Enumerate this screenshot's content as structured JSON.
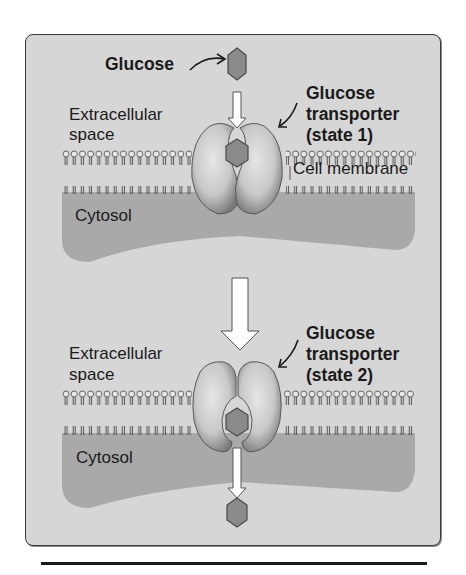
{
  "figure": {
    "colors": {
      "background": "#d6d6d6",
      "cytosol": "#a9a9a9",
      "glucose": "#8a8a8a",
      "protein": "#c4c4c4",
      "arrow": "#ffffff",
      "text": "#1a1a1a"
    },
    "panels": [
      {
        "id": "state-1",
        "labels": {
          "glucose": "Glucose",
          "extracellular_line1": "Extracellular",
          "extracellular_line2": "space",
          "transporter_line1": "Glucose",
          "transporter_line2": "transporter",
          "transporter_line3": "(state 1)",
          "membrane": "Cell membrane",
          "cytosol": "Cytosol"
        }
      },
      {
        "id": "state-2",
        "labels": {
          "extracellular_line1": "Extracellular",
          "extracellular_line2": "space",
          "transporter_line1": "Glucose",
          "transporter_line2": "transporter",
          "transporter_line3": "(state 2)",
          "cytosol": "Cytosol"
        }
      }
    ]
  }
}
